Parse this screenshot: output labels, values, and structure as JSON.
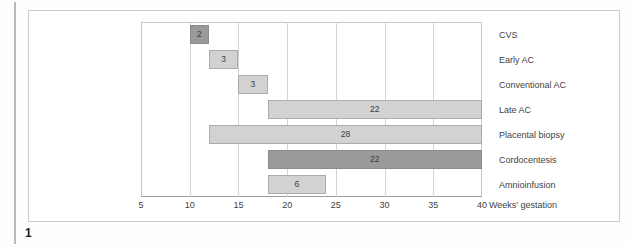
{
  "figure": {
    "number": "1",
    "colors": {
      "bar_light": "#d2d2d2",
      "bar_dark": "#9a9a9a",
      "bar_border": "#a9acae",
      "gridline": "#d2d5d7",
      "text": "#3f3f3f"
    }
  },
  "chart_data": {
    "type": "bar",
    "orientation": "horizontal",
    "title": "",
    "subtitle": "",
    "xlabel": "Weeks' gestation",
    "ylabel": "",
    "xlim": [
      5,
      40
    ],
    "xticks": [
      5,
      10,
      15,
      20,
      25,
      30,
      35,
      40
    ],
    "xtick_labels": [
      "5",
      "10",
      "15",
      "20",
      "25",
      "30",
      "35",
      "40"
    ],
    "grid": true,
    "legend": "none",
    "note": "Floating / range bars: each bar spans a gestational-age window; the printed number is the bar's width in weeks.",
    "categories": [
      "CVS",
      "Early AC",
      "Conventional AC",
      "Late AC",
      "Placental biopsy",
      "Cordocentesis",
      "Amnioinfusion"
    ],
    "values": [
      2,
      3,
      3,
      22,
      28,
      22,
      6
    ],
    "bars": [
      {
        "label": "CVS",
        "start": 10,
        "end": 12,
        "value": 2,
        "data_label": "2",
        "shade": "dark"
      },
      {
        "label": "Early AC",
        "start": 12,
        "end": 15,
        "value": 3,
        "data_label": "3",
        "shade": "light"
      },
      {
        "label": "Conventional AC",
        "start": 15,
        "end": 18,
        "value": 3,
        "data_label": "3",
        "shade": "light"
      },
      {
        "label": "Late AC",
        "start": 18,
        "end": 40,
        "value": 22,
        "data_label": "22",
        "shade": "light"
      },
      {
        "label": "Placental biopsy",
        "start": 12,
        "end": 40,
        "value": 28,
        "data_label": "28",
        "shade": "light"
      },
      {
        "label": "Cordocentesis",
        "start": 18,
        "end": 40,
        "value": 22,
        "data_label": "22",
        "shade": "dark"
      },
      {
        "label": "Amnioinfusion",
        "start": 18,
        "end": 24,
        "value": 6,
        "data_label": "6",
        "shade": "light"
      }
    ]
  }
}
